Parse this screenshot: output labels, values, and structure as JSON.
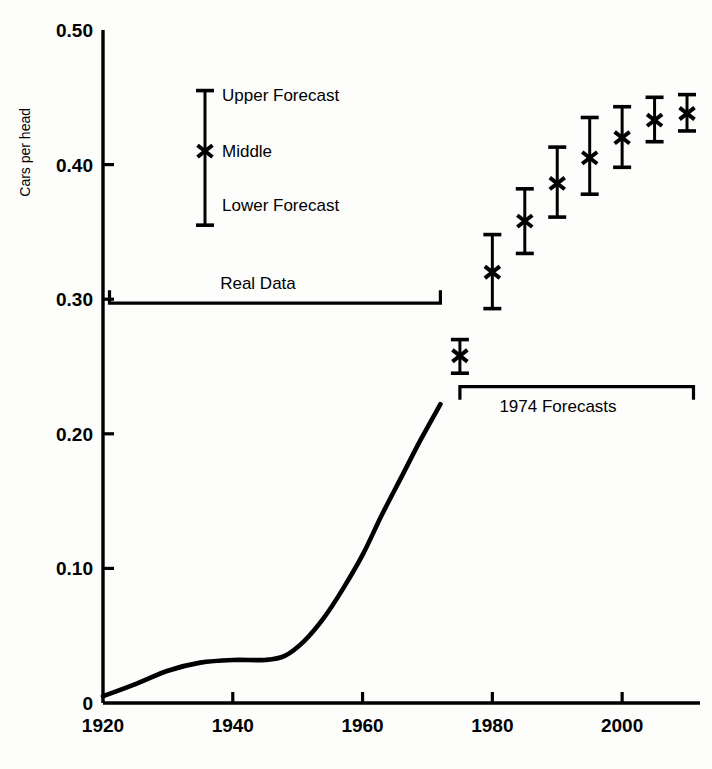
{
  "chart_data": {
    "type": "line",
    "title": "",
    "subtitle": "",
    "xlabel": "",
    "ylabel": "Cars per head",
    "xlim": [
      1920,
      2012
    ],
    "ylim": [
      0,
      0.5
    ],
    "grid": false,
    "legend_position": "upper-left-inside",
    "x_ticks": [
      1920,
      1940,
      1960,
      1980,
      2000
    ],
    "x_tick_labels": [
      "1920",
      "1940",
      "1960",
      "1980",
      "2000"
    ],
    "y_ticks": [
      0,
      0.1,
      0.2,
      0.3,
      0.4,
      0.5
    ],
    "y_tick_labels": [
      "0",
      "0.10",
      "0.20",
      "0.30",
      "0.40",
      "0.50"
    ],
    "series": [
      {
        "name": "Real Data",
        "type": "line",
        "x": [
          1920,
          1925,
          1930,
          1935,
          1940,
          1945,
          1948,
          1951,
          1954,
          1957,
          1960,
          1963,
          1966,
          1969,
          1972
        ],
        "values": [
          0.005,
          0.014,
          0.024,
          0.03,
          0.032,
          0.032,
          0.035,
          0.046,
          0.063,
          0.085,
          0.11,
          0.14,
          0.168,
          0.196,
          0.222
        ]
      },
      {
        "name": "1974 Forecasts",
        "type": "errorbar",
        "x": [
          1975,
          1980,
          1985,
          1990,
          1995,
          2000,
          2005,
          2010
        ],
        "middle": [
          0.258,
          0.32,
          0.358,
          0.386,
          0.405,
          0.42,
          0.433,
          0.438
        ],
        "upper": [
          0.27,
          0.348,
          0.382,
          0.413,
          0.435,
          0.443,
          0.45,
          0.452
        ],
        "lower": [
          0.245,
          0.293,
          0.334,
          0.361,
          0.378,
          0.398,
          0.417,
          0.425
        ]
      }
    ],
    "annotations": [
      {
        "name": "real-data-bracket",
        "label": "Real Data",
        "x_start": 1921,
        "x_end": 1972,
        "y": 0.297,
        "direction": "up"
      },
      {
        "name": "forecast-bracket",
        "label": "1974 Forecasts",
        "x_start": 1975,
        "x_end": 2011,
        "y": 0.235,
        "direction": "down"
      }
    ],
    "legend": {
      "sample_upper": 0.455,
      "sample_middle": 0.41,
      "sample_lower": 0.355,
      "entries": [
        {
          "key": "upper",
          "label": "Upper Forecast",
          "marker": "cap"
        },
        {
          "key": "middle",
          "label": "Middle",
          "marker": "cross"
        },
        {
          "key": "lower",
          "label": "Lower Forecast",
          "marker": "cap"
        }
      ]
    },
    "colors": {
      "ink": "#000000",
      "background": "#fdfdfc"
    }
  },
  "axis": {
    "y_title": "Cars per head",
    "y_labels": [
      "0.50",
      "0.40",
      "0.30",
      "0.20",
      "0.10",
      "0"
    ],
    "x_labels": [
      "1920",
      "1940",
      "1960",
      "1980",
      "2000"
    ]
  },
  "legend": {
    "upper_label": "Upper Forecast",
    "middle_label": "Middle",
    "lower_label": "Lower Forecast"
  },
  "annotations": {
    "real_data_label": "Real Data",
    "forecast_label": "1974 Forecasts"
  }
}
